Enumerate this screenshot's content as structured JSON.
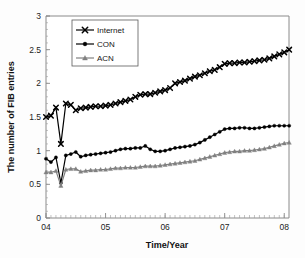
{
  "chart_data": {
    "type": "line",
    "title": "",
    "subtitle": "",
    "xlabel": "Time/Year",
    "ylabel": "The number of FIB entries",
    "xlim": [
      2004.0,
      2008.08
    ],
    "ylim": [
      0,
      3
    ],
    "yticks": [
      0,
      0.5,
      1,
      1.5,
      2,
      2.5,
      3
    ],
    "ytick_labels": [
      "0",
      "0.5",
      "1",
      "1.5",
      "2",
      "2.5",
      "3"
    ],
    "xticks": [
      2004,
      2005,
      2006,
      2007,
      2008
    ],
    "xtick_labels": [
      "04",
      "05",
      "06",
      "07",
      "08"
    ],
    "grid": false,
    "legend_position": "top-left-inside",
    "note": "y values are in units of 100k (x10^5) FIB entries; a sharp transient dip occurs near 04.25 in all three series",
    "x": [
      2004.0,
      2004.083,
      2004.167,
      2004.25,
      2004.333,
      2004.417,
      2004.5,
      2004.583,
      2004.667,
      2004.75,
      2004.833,
      2004.917,
      2005.0,
      2005.083,
      2005.167,
      2005.25,
      2005.333,
      2005.417,
      2005.5,
      2005.583,
      2005.667,
      2005.75,
      2005.833,
      2005.917,
      2006.0,
      2006.083,
      2006.167,
      2006.25,
      2006.333,
      2006.417,
      2006.5,
      2006.583,
      2006.667,
      2006.75,
      2006.833,
      2006.917,
      2007.0,
      2007.083,
      2007.167,
      2007.25,
      2007.333,
      2007.417,
      2007.5,
      2007.583,
      2007.667,
      2007.75,
      2007.833,
      2007.917,
      2008.0,
      2008.083
    ],
    "series": [
      {
        "name": "Internet",
        "marker": "x-cross",
        "color": "#000000",
        "values": [
          1.5,
          1.52,
          1.64,
          1.1,
          1.7,
          1.68,
          1.6,
          1.63,
          1.64,
          1.65,
          1.66,
          1.66,
          1.67,
          1.68,
          1.7,
          1.72,
          1.74,
          1.76,
          1.8,
          1.83,
          1.84,
          1.84,
          1.86,
          1.88,
          1.9,
          1.93,
          2.0,
          2.02,
          2.04,
          2.07,
          2.1,
          2.12,
          2.15,
          2.18,
          2.2,
          2.24,
          2.29,
          2.3,
          2.3,
          2.31,
          2.31,
          2.32,
          2.33,
          2.34,
          2.35,
          2.37,
          2.4,
          2.43,
          2.46,
          2.5
        ]
      },
      {
        "name": "CON",
        "marker": "circle",
        "color": "#000000",
        "values": [
          0.88,
          0.83,
          0.9,
          0.52,
          0.93,
          0.95,
          0.98,
          0.91,
          0.93,
          0.94,
          0.95,
          0.96,
          0.97,
          0.98,
          1.0,
          1.02,
          1.03,
          1.03,
          1.04,
          1.04,
          1.07,
          1.02,
          0.99,
          0.99,
          1.0,
          1.02,
          1.04,
          1.05,
          1.06,
          1.07,
          1.09,
          1.12,
          1.16,
          1.2,
          1.24,
          1.28,
          1.32,
          1.33,
          1.33,
          1.34,
          1.34,
          1.33,
          1.33,
          1.34,
          1.35,
          1.36,
          1.37,
          1.37,
          1.37,
          1.37
        ]
      },
      {
        "name": "ACN",
        "marker": "triangle",
        "color": "#808080",
        "values": [
          0.68,
          0.68,
          0.7,
          0.48,
          0.72,
          0.73,
          0.73,
          0.69,
          0.7,
          0.71,
          0.71,
          0.72,
          0.72,
          0.73,
          0.74,
          0.74,
          0.75,
          0.75,
          0.75,
          0.76,
          0.77,
          0.77,
          0.77,
          0.78,
          0.79,
          0.8,
          0.81,
          0.82,
          0.83,
          0.84,
          0.85,
          0.87,
          0.89,
          0.91,
          0.93,
          0.95,
          0.97,
          0.98,
          0.99,
          0.99,
          1.0,
          1.0,
          1.01,
          1.02,
          1.03,
          1.05,
          1.07,
          1.09,
          1.11,
          1.12
        ]
      }
    ]
  },
  "legend": {
    "entries": [
      {
        "label": "Internet",
        "marker": "x-cross",
        "color": "#000000"
      },
      {
        "label": "CON",
        "marker": "circle",
        "color": "#000000"
      },
      {
        "label": "ACN",
        "marker": "triangle",
        "color": "#808080"
      }
    ]
  },
  "axes": {
    "y_title": "The number of FIB entries",
    "x_title": "Time/Year"
  }
}
